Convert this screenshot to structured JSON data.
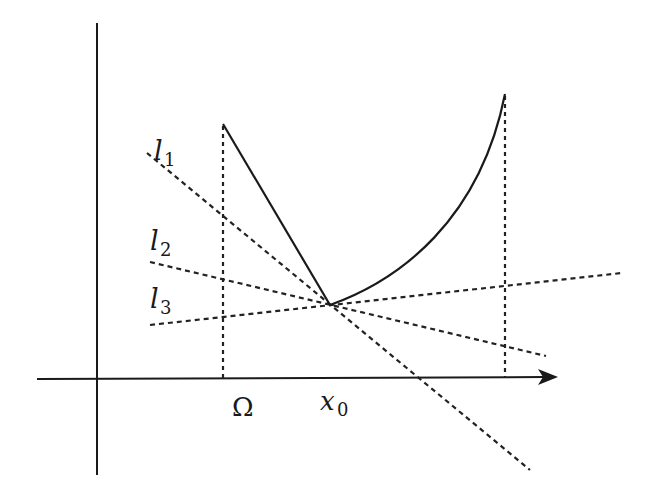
{
  "diagram": {
    "title": "",
    "labels": {
      "l1_main": "l",
      "l1_sub": "1",
      "l2_main": "l",
      "l2_sub": "2",
      "l3_main": "l",
      "l3_sub": "3",
      "omega": "Ω",
      "x0_main": "x",
      "x0_sub": "0"
    },
    "elements": [
      {
        "name": "y-axis",
        "type": "line",
        "style": "solid"
      },
      {
        "name": "x-axis",
        "type": "arrow",
        "style": "solid"
      },
      {
        "name": "function-left-segment",
        "type": "line",
        "style": "solid",
        "from": "Ω boundary top",
        "to": "x0 vertex"
      },
      {
        "name": "function-right-curve",
        "type": "convex-curve",
        "style": "solid",
        "from": "x0 vertex",
        "to": "right boundary top"
      },
      {
        "name": "omega-boundary",
        "type": "vertical",
        "style": "dotted"
      },
      {
        "name": "right-boundary",
        "type": "vertical",
        "style": "dotted"
      },
      {
        "name": "line-l1",
        "type": "line",
        "style": "dashed",
        "label": "l1"
      },
      {
        "name": "line-l2",
        "type": "line",
        "style": "dashed",
        "label": "l2"
      },
      {
        "name": "line-l3",
        "type": "line",
        "style": "dashed",
        "label": "l3"
      }
    ],
    "colors": {
      "stroke": "#1a1a1a",
      "background": "#ffffff"
    }
  }
}
